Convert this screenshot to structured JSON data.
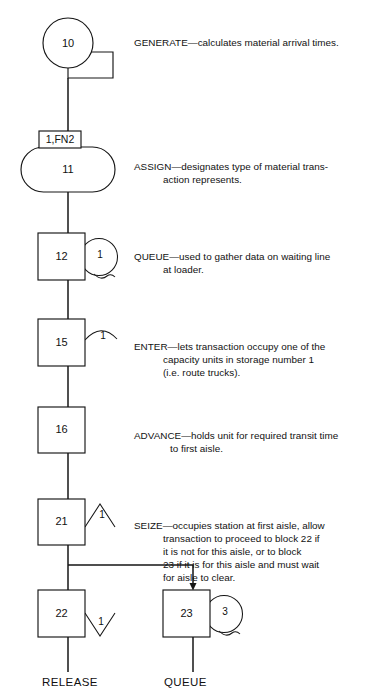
{
  "diagram": {
    "type": "flowchart",
    "blocks": [
      {
        "id": "generate",
        "number": "10",
        "shape": "circle-with-tab",
        "operand": "",
        "name": "GENERATE",
        "description_lines": [
          "GENERATE—calculates material arrival times."
        ]
      },
      {
        "id": "assign",
        "number": "11",
        "shape": "stadium",
        "operand": "1,FN2",
        "name": "ASSIGN",
        "description_lines": [
          "ASSIGN—designates type of material trans-",
          "         action represents."
        ]
      },
      {
        "id": "queue-12",
        "number": "12",
        "shape": "square-with-circle",
        "operand": "1",
        "name": "QUEUE",
        "description_lines": [
          "QUEUE—used to gather data on waiting line",
          "        at loader."
        ]
      },
      {
        "id": "enter-15",
        "number": "15",
        "shape": "square-with-arc",
        "operand": "1",
        "name": "ENTER",
        "description_lines": [
          "ENTER—lets transaction occupy one of the",
          "        capacity units in storage number 1",
          "        (i.e. route trucks)."
        ]
      },
      {
        "id": "advance-16",
        "number": "16",
        "shape": "square",
        "operand": "",
        "name": "ADVANCE",
        "description_lines": [
          "ADVANCE—holds unit for required transit time",
          "           to first aisle."
        ]
      },
      {
        "id": "seize-21",
        "number": "21",
        "shape": "square-with-caret",
        "operand": "1",
        "name": "SEIZE",
        "description_lines": [
          "SEIZE—occupies station at first aisle, allow",
          "        transaction to proceed to block 22 if",
          "        it is not for this aisle, or to block",
          "        23 if it is for this aisle and must wait",
          "        for aisle to clear."
        ]
      },
      {
        "id": "release-22",
        "number": "22",
        "shape": "square-with-vee",
        "operand": "1",
        "name": "RELEASE",
        "description_lines": []
      },
      {
        "id": "queue-23",
        "number": "23",
        "shape": "square-with-circle",
        "operand": "3",
        "name": "QUEUE",
        "description_lines": []
      }
    ],
    "footer_labels": [
      {
        "id": "release-label",
        "text": "RELEASE"
      },
      {
        "id": "queue-label",
        "text": "QUEUE"
      }
    ],
    "colors": {
      "stroke": "#161616",
      "fill": "#ffffff",
      "text": "#111111",
      "background": "#ffffff"
    }
  },
  "blocknum": {
    "b10": "10",
    "b11": "11",
    "b12": "12",
    "b15": "15",
    "b16": "16",
    "b21": "21",
    "b22": "22",
    "b23": "23"
  },
  "operands": {
    "assign_param": "1,FN2",
    "queue12": "1",
    "enter15": "1",
    "seize21": "1",
    "release22": "1",
    "queue23": "3"
  },
  "descriptions": {
    "generate": "GENERATE—calculates material arrival times.",
    "assign_l1": "ASSIGN—designates type of material trans-",
    "assign_l2": "action represents.",
    "queue12_l1": "QUEUE—used to gather data on waiting line",
    "queue12_l2": "at loader.",
    "enter15_l1": "ENTER—lets transaction occupy one of the",
    "enter15_l2": "capacity units in storage number 1",
    "enter15_l3": "(i.e. route trucks).",
    "advance16_l1": "ADVANCE—holds unit for required transit time",
    "advance16_l2": "to first aisle.",
    "seize21_l1": "SEIZE—occupies station at first aisle, allow",
    "seize21_l2": "transaction to proceed to block 22 if",
    "seize21_l3": "it is not for this aisle, or to block",
    "seize21_l4": "23 if it is for this aisle and must wait",
    "seize21_l5": "for aisle to clear."
  },
  "footer": {
    "release": "RELEASE",
    "queue": "QUEUE"
  }
}
